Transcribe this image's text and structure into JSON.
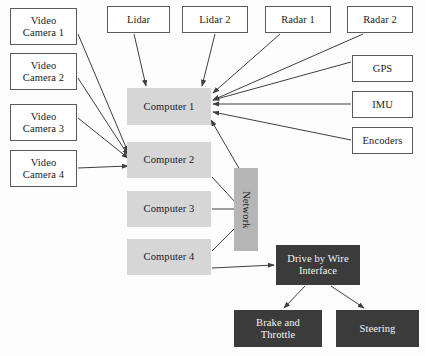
{
  "diagram": {
    "canvas": {
      "width": 425,
      "height": 356
    },
    "palette": {
      "background": "#fdfdfd",
      "sensor_fill": "#ffffff",
      "sensor_stroke": "#5a5a5a",
      "compute_fill": "#d6d6d6",
      "bus_fill": "#b6b6b6",
      "actuator_fill": "#3b3b3b",
      "actuator_text": "#f4f4f4",
      "edge_stroke": "#3f3f3f"
    },
    "nodes": [
      {
        "id": "video_camera_1",
        "label": "Video\nCamera 1",
        "kind": "sensor",
        "x": 10,
        "y": 8,
        "w": 67,
        "h": 37
      },
      {
        "id": "video_camera_2",
        "label": "Video\nCamera 2",
        "kind": "sensor",
        "x": 10,
        "y": 53,
        "w": 67,
        "h": 37
      },
      {
        "id": "video_camera_3",
        "label": "Video\nCamera 3",
        "kind": "sensor",
        "x": 10,
        "y": 104,
        "w": 67,
        "h": 37
      },
      {
        "id": "video_camera_4",
        "label": "Video\nCamera 4",
        "kind": "sensor",
        "x": 10,
        "y": 150,
        "w": 67,
        "h": 37
      },
      {
        "id": "lidar",
        "label": "Lidar",
        "kind": "sensor",
        "x": 107,
        "y": 6,
        "w": 63,
        "h": 27
      },
      {
        "id": "lidar_2",
        "label": "Lidar 2",
        "kind": "sensor",
        "x": 182,
        "y": 6,
        "w": 66,
        "h": 27
      },
      {
        "id": "radar_1",
        "label": "Radar 1",
        "kind": "sensor",
        "x": 265,
        "y": 6,
        "w": 66,
        "h": 27
      },
      {
        "id": "radar_2",
        "label": "Radar 2",
        "kind": "sensor",
        "x": 347,
        "y": 6,
        "w": 66,
        "h": 27
      },
      {
        "id": "gps",
        "label": "GPS",
        "kind": "sensor",
        "x": 352,
        "y": 55,
        "w": 61,
        "h": 27
      },
      {
        "id": "imu",
        "label": "IMU",
        "kind": "sensor",
        "x": 352,
        "y": 91,
        "w": 61,
        "h": 27
      },
      {
        "id": "encoders",
        "label": "Encoders",
        "kind": "sensor",
        "x": 352,
        "y": 127,
        "w": 61,
        "h": 27
      },
      {
        "id": "computer_1",
        "label": "Computer 1",
        "kind": "compute",
        "x": 127,
        "y": 88,
        "w": 84,
        "h": 37
      },
      {
        "id": "computer_2",
        "label": "Computer 2",
        "kind": "compute",
        "x": 127,
        "y": 142,
        "w": 84,
        "h": 36
      },
      {
        "id": "computer_3",
        "label": "Computer 3",
        "kind": "compute",
        "x": 127,
        "y": 191,
        "w": 84,
        "h": 36
      },
      {
        "id": "computer_4",
        "label": "Computer 4",
        "kind": "compute",
        "x": 127,
        "y": 239,
        "w": 84,
        "h": 36
      },
      {
        "id": "network",
        "label": "Network",
        "kind": "bus",
        "x": 234,
        "y": 168,
        "w": 24,
        "h": 83
      },
      {
        "id": "drive_by_wire",
        "label": "Drive by Wire\nInterface",
        "kind": "actuator",
        "x": 276,
        "y": 245,
        "w": 84,
        "h": 40
      },
      {
        "id": "brake_throttle",
        "label": "Brake and\nThrottle",
        "kind": "actuator",
        "x": 234,
        "y": 310,
        "w": 88,
        "h": 37
      },
      {
        "id": "steering",
        "label": "Steering",
        "kind": "actuator",
        "x": 336,
        "y": 310,
        "w": 83,
        "h": 37
      }
    ],
    "edges": [
      {
        "from": "video_camera_1",
        "to": "computer_2",
        "x1": 78,
        "y1": 34,
        "x2": 128,
        "y2": 152,
        "arrow": true
      },
      {
        "from": "video_camera_2",
        "to": "computer_2",
        "x1": 78,
        "y1": 78,
        "x2": 128,
        "y2": 155,
        "arrow": true
      },
      {
        "from": "video_camera_3",
        "to": "computer_2",
        "x1": 78,
        "y1": 118,
        "x2": 128,
        "y2": 158,
        "arrow": true
      },
      {
        "from": "video_camera_4",
        "to": "computer_2",
        "x1": 78,
        "y1": 168,
        "x2": 128,
        "y2": 166,
        "arrow": true
      },
      {
        "from": "lidar",
        "to": "computer_1",
        "x1": 134,
        "y1": 34,
        "x2": 146,
        "y2": 86,
        "arrow": true
      },
      {
        "from": "lidar_2",
        "to": "computer_1",
        "x1": 215,
        "y1": 34,
        "x2": 202,
        "y2": 86,
        "arrow": true
      },
      {
        "from": "radar_1",
        "to": "computer_1",
        "x1": 280,
        "y1": 34,
        "x2": 213,
        "y2": 93,
        "arrow": true
      },
      {
        "from": "radar_2",
        "to": "computer_1",
        "x1": 363,
        "y1": 34,
        "x2": 213,
        "y2": 100,
        "arrow": true
      },
      {
        "from": "gps",
        "to": "computer_1",
        "x1": 351,
        "y1": 62,
        "x2": 213,
        "y2": 100,
        "arrow": true
      },
      {
        "from": "imu",
        "to": "computer_1",
        "x1": 351,
        "y1": 104,
        "x2": 213,
        "y2": 104,
        "arrow": true
      },
      {
        "from": "encoders",
        "to": "computer_1",
        "x1": 351,
        "y1": 140,
        "x2": 213,
        "y2": 112,
        "arrow": true
      },
      {
        "from": "network",
        "to": "computer_1",
        "x1": 240,
        "y1": 170,
        "x2": 211,
        "y2": 120,
        "arrow": true
      },
      {
        "from": "computer_2",
        "to": "network",
        "x1": 212,
        "y1": 177,
        "x2": 236,
        "y2": 203,
        "arrow": false
      },
      {
        "from": "computer_3",
        "to": "network",
        "x1": 212,
        "y1": 209,
        "x2": 234,
        "y2": 209,
        "arrow": false
      },
      {
        "from": "computer_4",
        "to": "network",
        "x1": 212,
        "y1": 251,
        "x2": 236,
        "y2": 227,
        "arrow": false
      },
      {
        "from": "computer_4",
        "to": "drive_by_wire",
        "x1": 212,
        "y1": 268,
        "x2": 274,
        "y2": 265,
        "arrow": true
      },
      {
        "from": "drive_by_wire",
        "to": "brake_throttle",
        "x1": 305,
        "y1": 286,
        "x2": 284,
        "y2": 308,
        "arrow": true
      },
      {
        "from": "drive_by_wire",
        "to": "steering",
        "x1": 331,
        "y1": 286,
        "x2": 364,
        "y2": 308,
        "arrow": true
      }
    ]
  }
}
